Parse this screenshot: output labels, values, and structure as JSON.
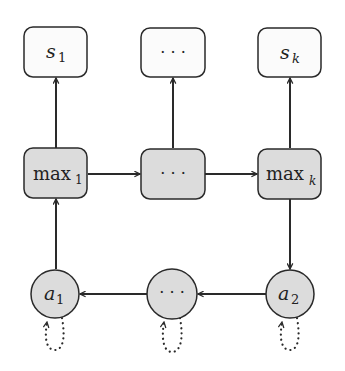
{
  "diagram": {
    "colors": {
      "stroke": "#2a2a2a",
      "box_white_fill": "#fbfbfb",
      "box_gray_fill": "#dcdcdc",
      "circle_fill": "#dcdcdc",
      "text": "#222222"
    },
    "top_row": [
      {
        "id": "s1",
        "base": "s",
        "sub": "1"
      },
      {
        "id": "s-dots",
        "base": "· · ·",
        "sub": ""
      },
      {
        "id": "sk",
        "base": "s",
        "sub": "k"
      }
    ],
    "middle_row": [
      {
        "id": "max1",
        "base": "max",
        "sub": "1"
      },
      {
        "id": "max-dots",
        "base": "· · ·",
        "sub": ""
      },
      {
        "id": "maxk",
        "base": "max",
        "sub": "k"
      }
    ],
    "bottom_row": [
      {
        "id": "a1",
        "base": "a",
        "sub": "1"
      },
      {
        "id": "a-dots",
        "base": "· · ·",
        "sub": ""
      },
      {
        "id": "a2",
        "base": "a",
        "sub": "2"
      }
    ],
    "edges": [
      {
        "from": "max1",
        "to": "s1",
        "style": "solid"
      },
      {
        "from": "max-dots",
        "to": "s-dots",
        "style": "solid"
      },
      {
        "from": "maxk",
        "to": "sk",
        "style": "solid"
      },
      {
        "from": "max1",
        "to": "max-dots",
        "style": "solid"
      },
      {
        "from": "max-dots",
        "to": "maxk",
        "style": "solid"
      },
      {
        "from": "maxk",
        "to": "a2",
        "style": "solid"
      },
      {
        "from": "a2",
        "to": "a-dots",
        "style": "solid"
      },
      {
        "from": "a-dots",
        "to": "a1",
        "style": "solid"
      },
      {
        "from": "a1",
        "to": "max1",
        "style": "solid"
      },
      {
        "from": "a1",
        "to": "a1",
        "style": "dotted-self-loop"
      },
      {
        "from": "a-dots",
        "to": "a-dots",
        "style": "dotted-self-loop"
      },
      {
        "from": "a2",
        "to": "a2",
        "style": "dotted-self-loop"
      }
    ]
  }
}
